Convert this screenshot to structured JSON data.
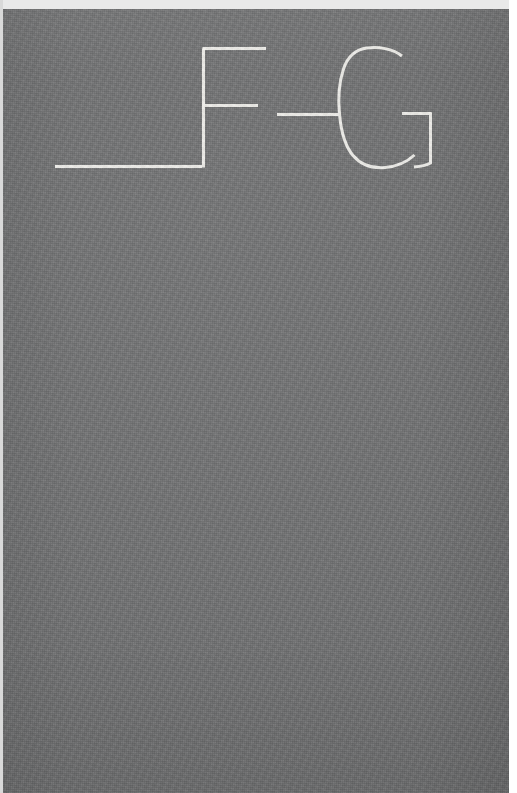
{
  "page": {
    "title": "_F-G",
    "width": 517,
    "height": 793,
    "orientation": "portrait",
    "medium": "photographed textured gray surface with painted white letterforms"
  },
  "colors": {
    "surface_gray": "#6f7071",
    "stroke_white": "#f3f2ee",
    "top_margin": "#e9e9e9",
    "right_margin": "#ffffff",
    "left_margin": "#d9d9d9"
  },
  "surface": {
    "name": "textured-gray-background",
    "fill": "#6f7071",
    "texture": "fine woven / grainy scan noise",
    "left": 3,
    "top": 9,
    "width": 506,
    "height": 784
  },
  "margins": {
    "top_label": "top light strip",
    "top_height": 9,
    "right_label": "right white margin",
    "right_width": 8,
    "left_label": "left light margin",
    "left_width": 3
  },
  "inscription": {
    "text": "_F-G",
    "reading": "underscore, letter F, hyphen, letter G",
    "style": "thin white outline strokes, uppercase, serif-less drafted forms",
    "stroke_color": "#f3f2ee",
    "stroke_width_px": 3,
    "baseline_y": 166,
    "cap_top_y": 48,
    "glyphs": [
      {
        "id": "glyph-underscore",
        "character": "_",
        "name": "underscore",
        "x_start": 52,
        "x_end": 200,
        "y": 166,
        "form": "single horizontal rule at baseline"
      },
      {
        "id": "glyph-f",
        "character": "F",
        "name": "letter-f",
        "x_start": 201,
        "x_end": 266,
        "y_top": 48,
        "y_bottom": 167,
        "form": "vertical stem with top arm and shorter middle arm"
      },
      {
        "id": "glyph-hyphen",
        "character": "-",
        "name": "hyphen",
        "x_start": 277,
        "x_end": 338,
        "y": 114,
        "form": "single short horizontal rule at mid height"
      },
      {
        "id": "glyph-g",
        "character": "G",
        "name": "letter-g",
        "x_start": 347,
        "x_end": 432,
        "y_top": 47,
        "y_bottom": 169,
        "form": "open bowl with horizontal spur and descending right stem"
      }
    ]
  },
  "layers": [
    {
      "name": "background-surface",
      "z": 0,
      "label": "gray textured field"
    },
    {
      "name": "grain-overlay",
      "z": 1,
      "label": "scan grain and weave"
    },
    {
      "name": "vignette-overlay",
      "z": 2,
      "label": "edge shading"
    },
    {
      "name": "glyph-strokes",
      "z": 3,
      "label": "white letter strokes"
    }
  ]
}
